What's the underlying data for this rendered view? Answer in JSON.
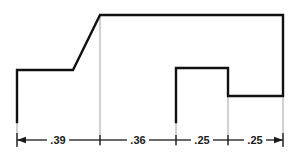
{
  "drawing": {
    "title": "stepped-profile-dimensioned-outline",
    "background_color": "#ffffff",
    "outline_color": "#111111",
    "extension_line_color": "#8c8c8c",
    "dimension_line_color": "#1a1a1a",
    "text_color": "#1a1a1a",
    "units_note": "",
    "profile": {
      "name": "stepped-block-profile",
      "points": "17,122 17,70 73,70 100,15 283,15 283,96 228,96 228,68 176,68 176,122",
      "stroke_width": 2.4
    },
    "extension_lines": [
      {
        "name": "extension-line-left",
        "x": 17,
        "y1": 122,
        "y2": 146
      },
      {
        "name": "extension-line-apex",
        "x": 100,
        "y1": 15,
        "y2": 146
      },
      {
        "name": "extension-line-notch-left",
        "x": 176,
        "y1": 68,
        "y2": 146
      },
      {
        "name": "extension-line-notch-right",
        "x": 228,
        "y1": 96,
        "y2": 146
      },
      {
        "name": "extension-line-right",
        "x": 283,
        "y1": 96,
        "y2": 146
      }
    ],
    "dimension_line": {
      "name": "horizontal-dimension-chain",
      "y": 140,
      "x_start": 17,
      "x_end": 283
    },
    "dimensions": [
      {
        "id": "dim-1",
        "label": ".39",
        "x_start": 17,
        "x_end": 100,
        "label_x": 58,
        "value": 0.39
      },
      {
        "id": "dim-2",
        "label": ".36",
        "x_start": 100,
        "x_end": 176,
        "label_x": 138,
        "value": 0.36
      },
      {
        "id": "dim-3",
        "label": ".25",
        "x_start": 176,
        "x_end": 228,
        "label_x": 202,
        "value": 0.25
      },
      {
        "id": "dim-4",
        "label": ".25",
        "x_start": 228,
        "x_end": 283,
        "label_x": 255,
        "value": 0.25
      }
    ],
    "tick_marks": [
      {
        "name": "dimension-tick-1",
        "x": 100
      },
      {
        "name": "dimension-tick-2",
        "x": 176
      },
      {
        "name": "dimension-tick-3",
        "x": 228
      }
    ],
    "arrowheads": [
      {
        "name": "arrowhead-left",
        "x": 17,
        "direction": "left"
      },
      {
        "name": "arrowhead-right",
        "x": 283,
        "direction": "right"
      }
    ]
  }
}
